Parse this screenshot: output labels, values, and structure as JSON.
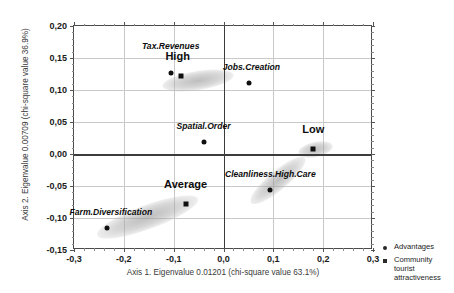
{
  "chart_data": {
    "type": "scatter",
    "title": "",
    "xlabel": "Axis 1. Eigenvalue 0.01201 (chi-square value 63.1%)",
    "ylabel": "Axis 2. Eigenvalue 0.00709 (chi-square value 36.9%)",
    "xlim": [
      -0.3,
      0.3
    ],
    "ylim": [
      -0.15,
      0.2
    ],
    "xticks": [
      "-0,3",
      "-0,2",
      "-0,1",
      "0,0",
      "0,1",
      "0,2",
      "0,3"
    ],
    "xtick_values": [
      -0.3,
      -0.2,
      -0.1,
      0.0,
      0.1,
      0.2,
      0.3
    ],
    "yticks": [
      "0,20",
      "0,15",
      "0,10",
      "0,05",
      "0,00",
      "-0,05",
      "-0,10",
      "-0,15"
    ],
    "ytick_values": [
      0.2,
      0.15,
      0.1,
      0.05,
      0.0,
      -0.05,
      -0.1,
      -0.15
    ],
    "grid": true,
    "legend_position": "right",
    "series": [
      {
        "name": "Advantages",
        "marker": "circle",
        "color": "#101010",
        "points": [
          {
            "label": "Tax.Revenues",
            "x": -0.106,
            "y": 0.1265,
            "label_dx": 0.0,
            "label_dy": 0.034,
            "label_style": "italic"
          },
          {
            "label": "Jobs.Creation",
            "x": 0.052,
            "y": 0.1105,
            "label_dx": 0.004,
            "label_dy": 0.018,
            "label_style": "italic"
          },
          {
            "label": "Spatial.Order",
            "x": -0.04,
            "y": 0.0185,
            "label_dx": 0.0,
            "label_dy": 0.018,
            "label_style": "italic"
          },
          {
            "label": "Cleanliness.High.Care",
            "x": 0.094,
            "y": -0.0565,
            "label_dx": 0.0,
            "label_dy": 0.017,
            "label_style": "italic"
          },
          {
            "label": "Farm.Diversification",
            "x": -0.234,
            "y": -0.1155,
            "label_dx": 0.008,
            "label_dy": 0.017,
            "label_style": "italic"
          }
        ]
      },
      {
        "name": "Community tourist attractiveness",
        "marker": "square",
        "color": "#101010",
        "points": [
          {
            "label": "High",
            "x": -0.086,
            "y": 0.1225,
            "label_dx": -0.006,
            "label_dy": 0.022,
            "label_style": "big"
          },
          {
            "label": "Low",
            "x": 0.18,
            "y": 0.0075,
            "label_dx": 0.0,
            "label_dy": 0.022,
            "label_style": "big"
          },
          {
            "label": "Average",
            "x": -0.076,
            "y": -0.0775,
            "label_dx": 0.0,
            "label_dy": 0.022,
            "label_style": "big"
          }
        ]
      }
    ],
    "clusters": [
      {
        "name": "high-cluster",
        "cx": -0.05,
        "cy": 0.115,
        "w": 0.145,
        "h": 0.03,
        "angle": -9
      },
      {
        "name": "low-cluster",
        "cx": 0.185,
        "cy": 0.006,
        "w": 0.07,
        "h": 0.024,
        "angle": -12
      },
      {
        "name": "average-cluster",
        "cx": -0.152,
        "cy": -0.0975,
        "w": 0.215,
        "h": 0.037,
        "angle": -20
      },
      {
        "name": "cleanliness-cluster",
        "cx": 0.11,
        "cy": -0.042,
        "w": 0.14,
        "h": 0.03,
        "angle": -40
      }
    ]
  },
  "legend": {
    "items": [
      {
        "label": "Advantages",
        "marker": "circle"
      },
      {
        "label": "Community tourist attractiveness",
        "marker": "square"
      }
    ]
  }
}
